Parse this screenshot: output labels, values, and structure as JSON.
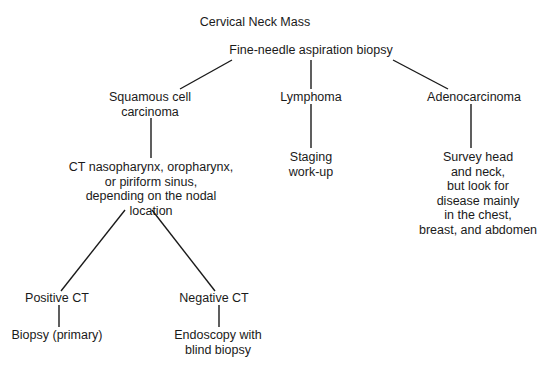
{
  "title": "Cervical Neck Mass",
  "nodes": {
    "fna": "Fine-needle aspiration biopsy",
    "squamous": [
      "Squamous cell",
      "carcinoma"
    ],
    "lymphoma": "Lymphoma",
    "adeno": "Adenocarcinoma",
    "ct": [
      "CT nasopharynx, oropharynx,",
      "or piriform sinus,",
      "depending on the nodal",
      "location"
    ],
    "staging": [
      "Staging",
      "work-up"
    ],
    "survey": [
      "Survey head",
      "and neck,",
      "but look for",
      "disease mainly",
      "in the chest,",
      "breast, and abdomen"
    ],
    "positive_ct": "Positive CT",
    "negative_ct": "Negative CT",
    "biopsy_primary": "Biopsy (primary)",
    "endoscopy": [
      "Endoscopy with",
      "blind biopsy"
    ]
  }
}
